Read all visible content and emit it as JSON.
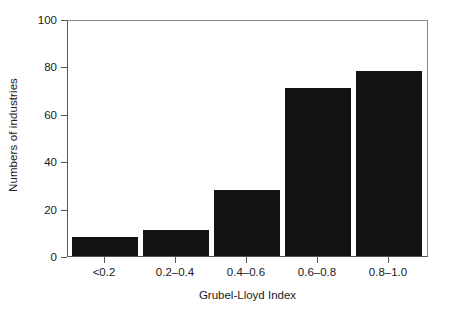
{
  "chart_data": {
    "type": "bar",
    "title": "",
    "xlabel": "Grubel-Lloyd Index",
    "ylabel": "Numbers of industries",
    "categories": [
      "<0.2",
      "0.2–0.4",
      "0.4–0.6",
      "0.6–0.8",
      "0.8–1.0"
    ],
    "values": [
      8,
      11,
      28,
      71,
      78
    ],
    "ylim": [
      0,
      100
    ],
    "yticks": [
      0,
      20,
      40,
      60,
      80,
      100
    ],
    "ytick_labels": [
      "0",
      "20",
      "40",
      "60",
      "80",
      "100"
    ],
    "grid": false,
    "legend": null,
    "bar_color": "#121212",
    "axis_color": "#555555",
    "background_color": "#ffffff"
  }
}
